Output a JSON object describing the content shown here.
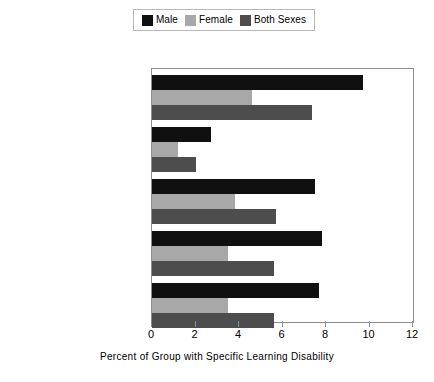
{
  "chart_data": {
    "type": "bar",
    "orientation": "horizontal",
    "title": "",
    "xlabel": "Percent of Group with Specific Learning Disability",
    "ylabel": "",
    "xlim": [
      0,
      12
    ],
    "xticks": [
      0,
      2,
      4,
      6,
      8,
      10,
      12
    ],
    "grid": false,
    "legend_position": "top-center",
    "categories": [
      "AMERICAN INDIAN",
      "ASIAN/PACIFIC ISLANDER",
      "HISPANIC",
      "BLACK",
      "WHITE"
    ],
    "series": [
      {
        "name": "Male",
        "color": "#101010",
        "values": [
          9.7,
          2.7,
          7.5,
          7.8,
          7.7
        ]
      },
      {
        "name": "Female",
        "color": "#a8a8a8",
        "values": [
          4.6,
          1.2,
          3.8,
          3.5,
          3.5
        ]
      },
      {
        "name": "Both Sexes",
        "color": "#4d4d4d",
        "values": [
          7.35,
          2.0,
          5.7,
          5.6,
          5.6
        ]
      }
    ]
  },
  "legend": {
    "entries": [
      {
        "label": "Male",
        "color": "#101010"
      },
      {
        "label": "Female",
        "color": "#a8a8a8"
      },
      {
        "label": "Both Sexes",
        "color": "#4d4d4d"
      }
    ]
  },
  "axis": {
    "x_title": "Percent of Group with Specific Learning Disability",
    "tick_labels": [
      "0",
      "2",
      "4",
      "6",
      "8",
      "10",
      "12"
    ]
  }
}
